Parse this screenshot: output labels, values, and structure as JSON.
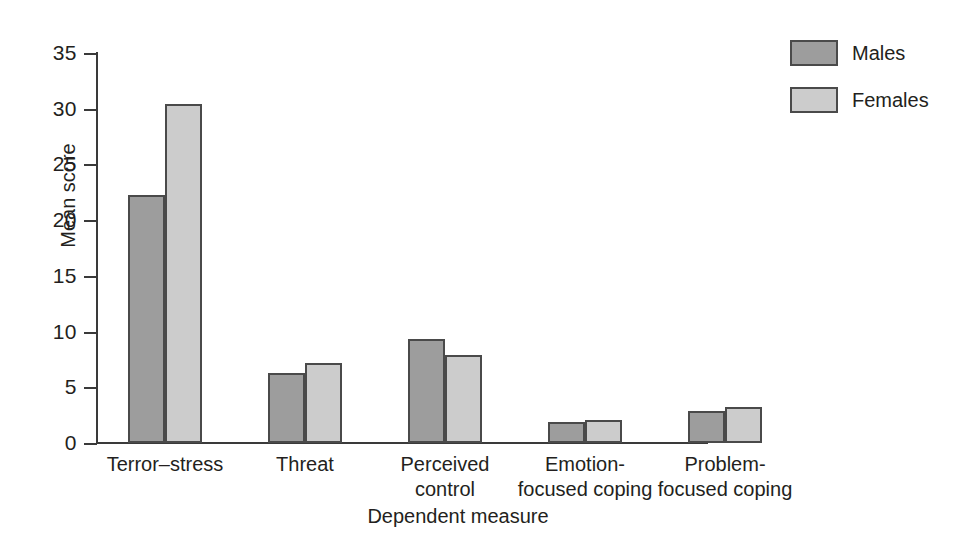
{
  "chart_data": {
    "type": "bar",
    "title": "",
    "xlabel": "Dependent measure",
    "ylabel": "Mean score",
    "categories": [
      "Terror–stress",
      "Threat",
      "Perceived\ncontrol",
      "Emotion-\nfocused coping",
      "Problem-\nfocused coping"
    ],
    "series": [
      {
        "name": "Males",
        "values": [
          22.3,
          6.3,
          9.3,
          1.9,
          2.9
        ],
        "color": "#9d9d9d"
      },
      {
        "name": "Females",
        "values": [
          30.4,
          7.2,
          7.9,
          2.1,
          3.2
        ],
        "color": "#cccccc"
      }
    ],
    "ylim": [
      0,
      35
    ],
    "yticks": [
      0,
      5,
      10,
      15,
      20,
      25,
      30,
      35
    ],
    "ytick_labels": [
      "0",
      "5",
      "10",
      "15",
      "20",
      "25",
      "30",
      "35"
    ],
    "grid": false,
    "legend_position": "top-right",
    "axis_color": "#3a3a3a",
    "bar_edge_color": "#4a4a4a",
    "background": "#ffffff"
  },
  "legend": {
    "entries": [
      {
        "label": "Males",
        "swatch": "males-swatch"
      },
      {
        "label": "Females",
        "swatch": "females-swatch"
      }
    ]
  }
}
